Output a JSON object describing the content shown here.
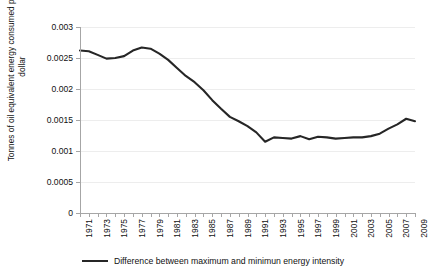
{
  "chart_data": {
    "type": "line",
    "title": "",
    "xlabel": "",
    "ylabel": "Tonnes of oil equivalent energy consumed per GDP dollar",
    "ylim": [
      0,
      0.003
    ],
    "xlim": [
      1971,
      2009
    ],
    "grid": true,
    "legend_position": "bottom",
    "y_ticks": [
      0,
      0.0005,
      0.001,
      0.0015,
      0.002,
      0.0025,
      0.003
    ],
    "y_tick_labels": [
      "0",
      "0.0005",
      "0.001",
      "0.0015",
      "0.002",
      "0.0025",
      "0.003"
    ],
    "x_tick_labels": [
      "1971",
      "1973",
      "1975",
      "1977",
      "1979",
      "1981",
      "1983",
      "1985",
      "1987",
      "1989",
      "1991",
      "1993",
      "1995",
      "1997",
      "1999",
      "2001",
      "2003",
      "2005",
      "2007",
      "2009"
    ],
    "x": [
      1971,
      1972,
      1973,
      1974,
      1975,
      1976,
      1977,
      1978,
      1979,
      1980,
      1981,
      1982,
      1983,
      1984,
      1985,
      1986,
      1987,
      1988,
      1989,
      1990,
      1991,
      1992,
      1993,
      1994,
      1995,
      1996,
      1997,
      1998,
      1999,
      2000,
      2001,
      2002,
      2003,
      2004,
      2005,
      2006,
      2007,
      2008,
      2009
    ],
    "series": [
      {
        "name": "Difference between maximum and minimun energy intensity",
        "color": "#262626",
        "values": [
          0.00262,
          0.00261,
          0.00255,
          0.00249,
          0.0025,
          0.00253,
          0.00262,
          0.00267,
          0.00265,
          0.00257,
          0.00247,
          0.00234,
          0.00221,
          0.00211,
          0.00198,
          0.00182,
          0.00168,
          0.00155,
          0.00148,
          0.0014,
          0.0013,
          0.00115,
          0.00122,
          0.00121,
          0.0012,
          0.00124,
          0.00119,
          0.00123,
          0.00122,
          0.0012,
          0.00121,
          0.00122,
          0.00122,
          0.00124,
          0.00128,
          0.00136,
          0.00143,
          0.00152,
          0.00148
        ]
      }
    ]
  },
  "legend": {
    "entries": [
      {
        "label": "Difference between maximum and minimun energy intensity"
      }
    ]
  }
}
